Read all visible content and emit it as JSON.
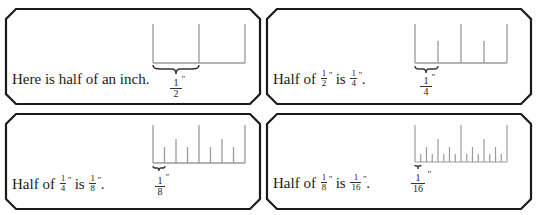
{
  "panels": [
    {
      "id": "half-inch",
      "sentence_plain": "Here is half of an inch.",
      "text_before": "Here is half of an inch.",
      "ruler_label": {
        "num": "1",
        "den": "2",
        "mark": "″"
      },
      "ticks_per_inch": 2
    },
    {
      "id": "quarter-inch",
      "sentence_parts": {
        "prefix": "Half of ",
        "frac1": {
          "num": "1",
          "den": "2"
        },
        "middle": " is ",
        "frac2": {
          "num": "1",
          "den": "4"
        },
        "suffix": "."
      },
      "ruler_label": {
        "num": "1",
        "den": "4",
        "mark": "″"
      },
      "ticks_per_inch": 4
    },
    {
      "id": "eighth-inch",
      "sentence_parts": {
        "prefix": "Half of ",
        "frac1": {
          "num": "1",
          "den": "4"
        },
        "middle": " is ",
        "frac2": {
          "num": "1",
          "den": "8"
        },
        "suffix": "."
      },
      "ruler_label": {
        "num": "1",
        "den": "8",
        "mark": "″"
      },
      "ticks_per_inch": 8
    },
    {
      "id": "sixteenth-inch",
      "sentence_parts": {
        "prefix": "Half of ",
        "frac1": {
          "num": "1",
          "den": "8"
        },
        "middle": " is ",
        "frac2": {
          "num": "1",
          "den": "16"
        },
        "suffix": "."
      },
      "ruler_label": {
        "num": "1",
        "den": "16",
        "mark": "″"
      },
      "ticks_per_inch": 16
    }
  ],
  "inch_mark": "″",
  "colors": {
    "frame": "#1a1a1a",
    "ruler": "#9a9a9a",
    "text": "#1a1a1a"
  }
}
